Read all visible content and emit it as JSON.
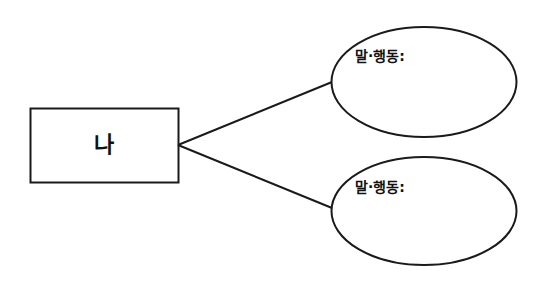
{
  "diagram": {
    "type": "mind-map",
    "center_node": {
      "label": "나",
      "shape": "rectangle"
    },
    "branches": [
      {
        "label": "말·행동:",
        "shape": "ellipse",
        "content": ""
      },
      {
        "label": "말·행동:",
        "shape": "ellipse",
        "content": ""
      }
    ],
    "colors": {
      "stroke": "#1a1a1a",
      "background": "#ffffff",
      "text": "#111111"
    }
  }
}
